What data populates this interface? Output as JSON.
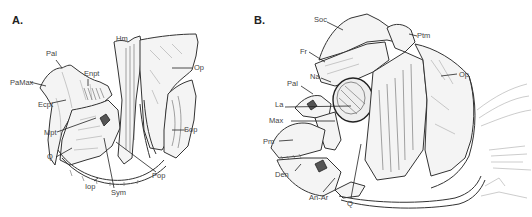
{
  "figure": {
    "type": "scientific-illustration"
  },
  "panelA": {
    "letter": "A.",
    "labels": {
      "Pal": "Pal",
      "PaMax": "PaMax",
      "Enpt": "Enpt",
      "Ecpt": "Ecpt",
      "Mpt": "Mpt",
      "Q": "Q",
      "Iop": "Iop",
      "Sym": "Sym",
      "Pop": "Pop",
      "Hm": "Hm",
      "Op": "Op",
      "Sop": "Sop"
    }
  },
  "panelB": {
    "letter": "B.",
    "labels": {
      "Soc": "Soc",
      "Ptm": "Ptm",
      "Fr": "Fr",
      "Na": "Na",
      "Pal": "Pal",
      "La": "La",
      "Max": "Max",
      "Op": "Op",
      "Pm": "Pm",
      "Den": "Den",
      "AnAr": "An-Ar",
      "Q": "Q"
    }
  }
}
